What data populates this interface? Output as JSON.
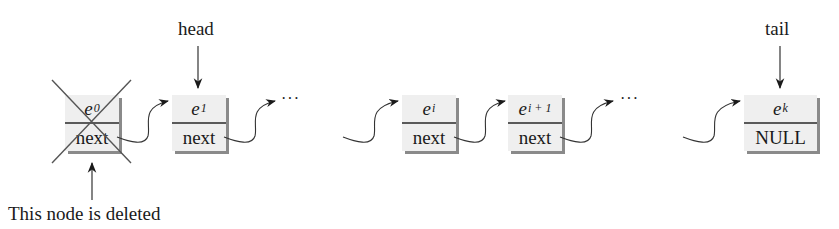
{
  "diagram": {
    "type": "singly-linked-list-delete-head",
    "pointers": {
      "head": "head",
      "tail": "tail"
    },
    "nodes": [
      {
        "id": "e0",
        "element": "e",
        "subscript": "0",
        "link": "next",
        "deleted": true
      },
      {
        "id": "e1",
        "element": "e",
        "subscript": "1",
        "link": "next",
        "deleted": false
      },
      {
        "id": "ei",
        "element": "e",
        "subscript": "i",
        "link": "next",
        "deleted": false
      },
      {
        "id": "ei1",
        "element": "e",
        "subscript": "i + 1",
        "link": "next",
        "deleted": false
      },
      {
        "id": "ek",
        "element": "e",
        "subscript": "k",
        "link": "NULL",
        "deleted": false
      }
    ],
    "ellipses": [
      "···",
      "···"
    ],
    "annotation": "This node is deleted",
    "colors": {
      "node_fill": "#efefef",
      "node_shadow": "#8a8a8a",
      "divider": "#5a5a5a",
      "line": "#333333",
      "cross": "#555555"
    }
  }
}
